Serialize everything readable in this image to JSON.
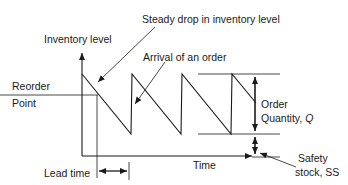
{
  "diagram": {
    "type": "inventory-sawtooth",
    "labels": {
      "y_axis": "Inventory level",
      "x_axis": "Time",
      "steady_drop": "Steady drop in inventory level",
      "arrival": "Arrival of an order",
      "reorder_line1": "Reorder",
      "reorder_line2": "Point",
      "order_qty_line1": "Order",
      "order_qty_line2": "Quantity, ",
      "order_qty_symbol": "Q",
      "safety_line1": "Safety",
      "safety_line2": "stock, SS",
      "lead_time": "Lead time"
    },
    "colors": {
      "line": "#1a1a1a",
      "background": "#ffffff"
    }
  }
}
